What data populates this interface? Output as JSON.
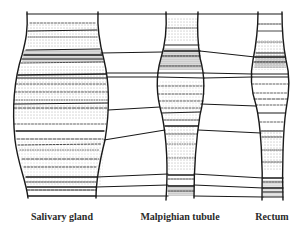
{
  "figure": {
    "type": "banding-pattern-comparison",
    "columns": [
      {
        "id": "salivary",
        "label": "Salivary gland",
        "label_x": 62
      },
      {
        "id": "malpighian",
        "label": "Malpighian tubule",
        "label_x": 180
      },
      {
        "id": "rectum",
        "label": "Rectum",
        "label_x": 272
      }
    ],
    "colors": {
      "ink": "#1a1a1a",
      "background": "#ffffff"
    }
  }
}
